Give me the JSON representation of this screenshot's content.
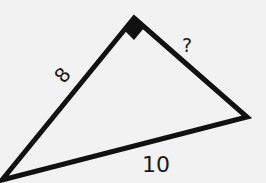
{
  "diagram": {
    "type": "right-triangle",
    "sides": {
      "left_leg": "8",
      "right_leg": "?",
      "hypotenuse": "10"
    },
    "right_angle_marker": "filled-square",
    "colors": {
      "stroke": "#111111",
      "background": "#f2f2f2",
      "text": "#1a1a1a"
    }
  }
}
